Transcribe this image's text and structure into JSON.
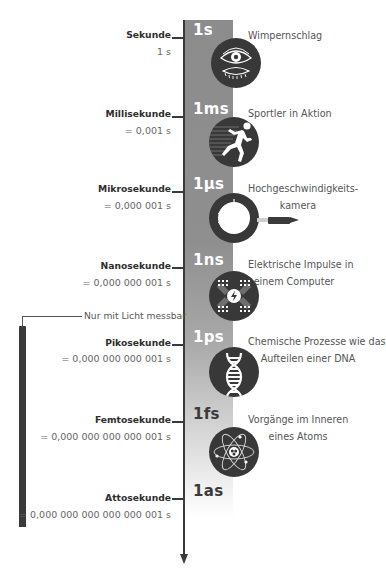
{
  "timeline": {
    "colors": {
      "band_top": "#8c8c8c",
      "axis": "#3a3a3a",
      "icon_bg": "#383838"
    },
    "entries": [
      {
        "unit": "1s",
        "name": "Sekunde",
        "value": "1 s",
        "description_lines": [
          "Wimpernschlag"
        ],
        "icon": "eye-blink-icon"
      },
      {
        "unit": "1ms",
        "name": "Millisekunde",
        "value": "= 0,001 s",
        "description_lines": [
          "Sportler in Aktion"
        ],
        "icon": "sprinter-icon"
      },
      {
        "unit": "1µs",
        "name": "Mikrosekunde",
        "value": "= 0,000 001 s",
        "description_lines": [
          "Hochgeschwindigkeits-",
          "kamera"
        ],
        "icon": "bullet-apple-icon"
      },
      {
        "unit": "1ns",
        "name": "Nanosekunde",
        "value": "= 0,000 000 001 s",
        "description_lines": [
          "Elektrische Impulse in",
          "einem Computer"
        ],
        "icon": "circuit-chip-icon"
      },
      {
        "unit": "1ps",
        "name": "Pikosekunde",
        "value": "= 0,000 000 000 001 s",
        "description_lines": [
          "Chemische Prozesse wie das",
          "Aufteilen einer DNA"
        ],
        "icon": "dna-icon"
      },
      {
        "unit": "1fs",
        "name": "Femtosekunde",
        "value": "= 0,000 000 000 000 001 s",
        "description_lines": [
          "Vorgänge im Inneren",
          "eines Atoms"
        ],
        "icon": "atom-icon"
      },
      {
        "unit": "1as",
        "name": "Attosekunde",
        "value": "= 0,000 000 000 000 000 001 s",
        "description_lines": [],
        "icon": null
      }
    ]
  },
  "light_range": {
    "label": "Nur mit Licht messbar"
  }
}
